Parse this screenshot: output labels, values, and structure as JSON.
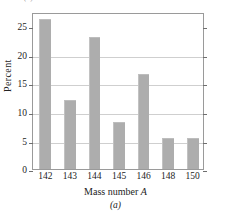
{
  "figure": {
    "clipped_top_text": "table (b).",
    "caption": "(a)"
  },
  "chart_data": {
    "type": "bar",
    "title": "",
    "subtitle": "",
    "categories": [
      "142",
      "143",
      "144",
      "145",
      "146",
      "148",
      "150"
    ],
    "values": [
      26.3,
      12.1,
      23.2,
      8.2,
      16.6,
      5.4,
      5.4
    ],
    "series": [
      {
        "name": "Percent abundance",
        "values": [
          26.3,
          12.1,
          23.2,
          8.2,
          16.6,
          5.4,
          5.4
        ]
      }
    ],
    "xlabel": "Mass number A",
    "xlabel_plain": "Mass number",
    "xlabel_italic": "A",
    "ylabel": "Percent",
    "ylim": [
      0,
      27.5
    ],
    "xtick_labels": [
      "142",
      "143",
      "144",
      "145",
      "146",
      "148",
      "150"
    ],
    "ytick_labels": [
      "0",
      "5",
      "10",
      "15",
      "20",
      "25"
    ],
    "ytick_values": [
      0,
      5,
      10,
      15,
      20,
      25
    ],
    "gridline_values": [
      5,
      10,
      15,
      20
    ],
    "grid": true,
    "legend": "none",
    "bar_color": "#adadad",
    "grid_color": "#cfcfcf",
    "frame_color": "#9a9a9a",
    "text_color": "#232323"
  }
}
